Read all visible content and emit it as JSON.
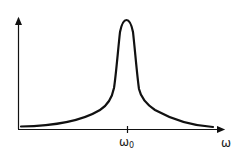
{
  "diagram": {
    "type": "resonance-curve",
    "x_axis": {
      "label": "ω",
      "tick_label": "ω",
      "tick_subscript": "0"
    },
    "y_axis": {
      "label": ""
    },
    "colors": {
      "stroke": "#111111",
      "background": "#ffffff"
    }
  }
}
